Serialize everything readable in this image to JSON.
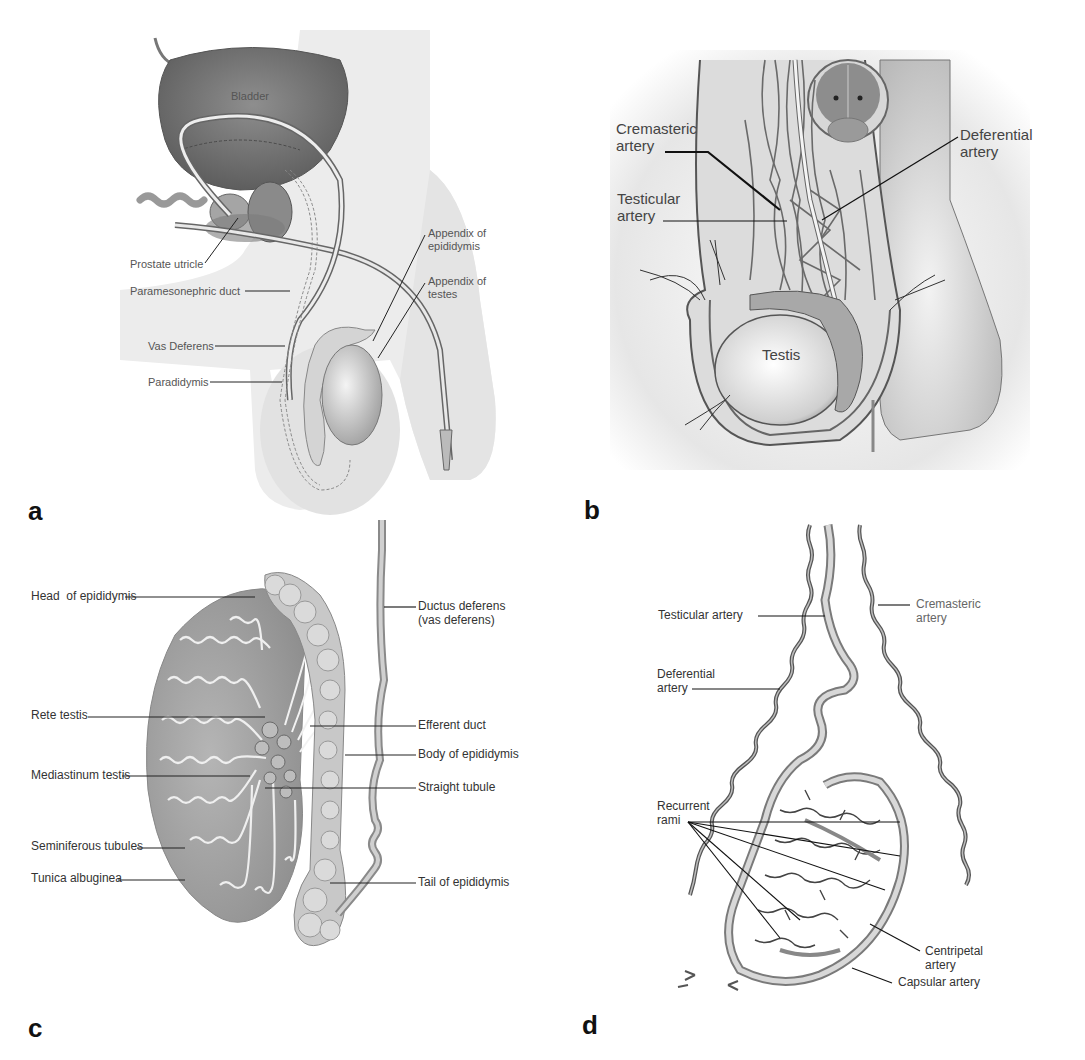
{
  "figure": {
    "panels": [
      {
        "id": "a",
        "letter": "a",
        "labels": {
          "bladder": "Bladder",
          "prostate_utricle": "Prostate utricle",
          "paramesonephric_duct": "Paramesonephric duct",
          "vas_deferens": "Vas Deferens",
          "paradidymis": "Paradidymis",
          "appendix_epididymis": "Appendix of\nepididymis",
          "appendix_testes": "Appendix of\ntestes"
        }
      },
      {
        "id": "b",
        "letter": "b",
        "labels": {
          "cremasteric_artery": "Cremasteric\nartery",
          "testicular_artery": "Testicular\nartery",
          "deferential_artery": "Deferential\nartery",
          "testis": "Testis"
        }
      },
      {
        "id": "c",
        "letter": "c",
        "labels": {
          "head_epididymis": "Head  of epididymis",
          "rete_testis": "Rete testis",
          "mediastinum_testis": "Mediastinum testis",
          "seminiferous_tubules": "Seminiferous tubules",
          "tunica_albuginea": "Tunica albuginea",
          "ductus_deferens": "Ductus deferens\n(vas deferens)",
          "efferent_duct": "Efferent duct",
          "body_epididymis": "Body of epididymis",
          "straight_tubule": "Straight tubule",
          "tail_epididymis": "Tail of epididymis"
        }
      },
      {
        "id": "d",
        "letter": "d",
        "labels": {
          "testicular_artery": "Testicular artery",
          "cremasteric_artery": "Cremasteric\nartery",
          "deferential_artery": "Deferential\nartery",
          "recurrent_rami": "Recurrent\nrami",
          "centripetal_artery": "Centripetal\nartery",
          "capsular_artery": "Capsular artery"
        }
      }
    ]
  }
}
